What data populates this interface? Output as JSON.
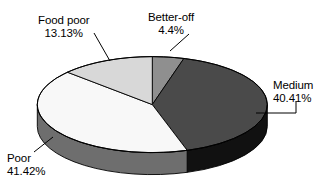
{
  "chart_data": {
    "type": "pie",
    "title": "",
    "subtitle": "",
    "xlabel": "",
    "ylabel": "",
    "legend": "none",
    "grid": false,
    "style": "3d-pie",
    "unit": "%",
    "categories": [
      "Better-off",
      "Medium",
      "Poor",
      "Food poor"
    ],
    "values": [
      4.4,
      40.41,
      41.42,
      13.13
    ],
    "slices": [
      {
        "name": "Better-off",
        "label": "Better-off",
        "value": 4.4,
        "value_text": "4.4%",
        "top_color": "#8f8f8f",
        "side_color": "#6a6a6a",
        "start_angle": 0,
        "end_angle": 15.84
      },
      {
        "name": "Medium",
        "label": "Medium",
        "value": 40.41,
        "value_text": "40.41%",
        "top_color": "#4a4a4a",
        "side_color": "#111111",
        "start_angle": 15.84,
        "end_angle": 161.32
      },
      {
        "name": "Poor",
        "label": "Poor",
        "value": 41.42,
        "value_text": "41.42%",
        "top_color": "#f8f8f8",
        "side_color": "#6e6e6e",
        "start_angle": 161.32,
        "end_angle": 310.43
      },
      {
        "name": "Food poor",
        "label": "Food poor",
        "value": 13.13,
        "value_text": "13.13%",
        "top_color": "#d8d8d8",
        "side_color": "#9c9c9c",
        "start_angle": 310.43,
        "end_angle": 360
      }
    ],
    "labels": {
      "food_poor": {
        "name": "Food poor",
        "percent": "13.13%"
      },
      "better_off": {
        "name": "Better-off",
        "percent": "4.4%"
      },
      "medium": {
        "name": "Medium",
        "percent": "40.41%"
      },
      "poor": {
        "name": "Poor",
        "percent": "41.42%"
      }
    },
    "colors": {
      "background": "#ffffff",
      "text": "#000000",
      "outline": "#000000",
      "leader_line": "#000000"
    }
  }
}
